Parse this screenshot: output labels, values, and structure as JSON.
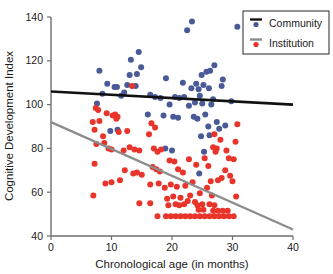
{
  "chart_data": {
    "type": "scatter",
    "title": "",
    "xlabel": "Chronological age (in months)",
    "ylabel": "Cognitive Development Index",
    "xlim": [
      0,
      40
    ],
    "ylim": [
      40,
      140
    ],
    "xticks": [
      0,
      10,
      20,
      30,
      40
    ],
    "yticks": [
      40,
      60,
      80,
      100,
      120,
      140
    ],
    "xtick_labels": [
      "0",
      "10",
      "20",
      "30",
      "40"
    ],
    "ytick_labels": [
      "40",
      "60",
      "80",
      "100",
      "120",
      "140"
    ],
    "grid": false,
    "legend_position": "top-right",
    "legend": [
      {
        "label": "Community",
        "point_color": "#4a5a96",
        "line_color": "#111111"
      },
      {
        "label": "Institution",
        "point_color": "#e8342a",
        "line_color": "#8c8c8c"
      }
    ],
    "series": [
      {
        "name": "Community",
        "marker_color": "#4a5a96",
        "marker_size": 3.0,
        "trendline": {
          "color": "#111111",
          "width": 2.6,
          "x0": 0,
          "y0": 106,
          "x1": 40,
          "y1": 100
        },
        "points": [
          [
            22.5,
            134.0
          ],
          [
            23.3,
            138.0
          ],
          [
            30.8,
            135.5
          ],
          [
            14.5,
            124.0
          ],
          [
            13.2,
            120.5
          ],
          [
            14.9,
            117.0
          ],
          [
            27.0,
            118.0
          ],
          [
            25.7,
            115.0
          ],
          [
            26.3,
            115.5
          ],
          [
            8.0,
            115.5
          ],
          [
            13.0,
            113.5
          ],
          [
            14.2,
            114.0
          ],
          [
            24.9,
            113.5
          ],
          [
            28.4,
            111.5
          ],
          [
            19.0,
            112.0
          ],
          [
            21.8,
            110.0
          ],
          [
            24.0,
            109.5
          ],
          [
            25.2,
            109.0
          ],
          [
            28.2,
            108.5
          ],
          [
            12.6,
            109.0
          ],
          [
            14.0,
            108.5
          ],
          [
            9.3,
            109.5
          ],
          [
            10.5,
            108.0
          ],
          [
            10.9,
            108.0
          ],
          [
            23.2,
            107.5
          ],
          [
            24.4,
            107.0
          ],
          [
            26.1,
            107.5
          ],
          [
            8.5,
            105.0
          ],
          [
            11.6,
            104.0
          ],
          [
            12.1,
            105.5
          ],
          [
            16.4,
            104.5
          ],
          [
            17.2,
            103.5
          ],
          [
            20.5,
            103.5
          ],
          [
            21.2,
            103.0
          ],
          [
            22.0,
            103.5
          ],
          [
            24.6,
            104.0
          ],
          [
            26.8,
            102.5
          ],
          [
            29.8,
            101.5
          ],
          [
            18.1,
            103.0
          ],
          [
            23.8,
            101.0
          ],
          [
            25.0,
            100.5
          ],
          [
            26.5,
            100.0
          ],
          [
            7.6,
            100.5
          ],
          [
            19.6,
            100.0
          ],
          [
            22.8,
            99.5
          ],
          [
            16.0,
            95.5
          ],
          [
            18.6,
            95.0
          ],
          [
            20.2,
            94.5
          ],
          [
            21.0,
            94.0
          ],
          [
            23.6,
            94.5
          ],
          [
            24.2,
            93.5
          ],
          [
            25.5,
            95.5
          ],
          [
            27.4,
            92.0
          ],
          [
            28.8,
            90.5
          ],
          [
            26.0,
            90.0
          ],
          [
            27.8,
            89.0
          ],
          [
            9.8,
            88.0
          ],
          [
            11.0,
            88.5
          ],
          [
            24.8,
            85.5
          ],
          [
            26.2,
            86.0
          ],
          [
            18.9,
            80.0
          ],
          [
            25.3,
            78.5
          ],
          [
            20.0,
            79.0
          ],
          [
            24.5,
            68.5
          ]
        ]
      },
      {
        "name": "Institution",
        "marker_color": "#e8342a",
        "marker_size": 3.0,
        "trendline": {
          "color": "#8c8c8c",
          "width": 2.2,
          "x0": 0,
          "y0": 92,
          "x1": 40,
          "y1": 43
        },
        "points": [
          [
            7.4,
            98.5
          ],
          [
            7.8,
            97.5
          ],
          [
            9.2,
            96.0
          ],
          [
            10.6,
            95.5
          ],
          [
            11.0,
            94.5
          ],
          [
            13.4,
            108.5
          ],
          [
            30.8,
            91.0
          ],
          [
            6.9,
            92.0
          ],
          [
            8.0,
            92.5
          ],
          [
            10.2,
            95.0
          ],
          [
            10.8,
            93.5
          ],
          [
            7.2,
            88.5
          ],
          [
            8.6,
            85.5
          ],
          [
            11.2,
            87.5
          ],
          [
            12.6,
            88.0
          ],
          [
            16.6,
            91.5
          ],
          [
            17.2,
            89.5
          ],
          [
            27.0,
            86.5
          ],
          [
            28.0,
            84.0
          ],
          [
            30.5,
            83.0
          ],
          [
            7.5,
            82.0
          ],
          [
            8.8,
            82.5
          ],
          [
            9.5,
            80.0
          ],
          [
            10.0,
            79.5
          ],
          [
            12.0,
            79.0
          ],
          [
            13.0,
            80.5
          ],
          [
            13.8,
            79.5
          ],
          [
            14.6,
            79.0
          ],
          [
            17.0,
            80.0
          ],
          [
            17.6,
            78.5
          ],
          [
            18.2,
            79.5
          ],
          [
            26.8,
            80.5
          ],
          [
            27.4,
            80.0
          ],
          [
            27.2,
            78.5
          ],
          [
            29.4,
            75.5
          ],
          [
            30.2,
            75.0
          ],
          [
            29.0,
            79.0
          ],
          [
            25.4,
            75.5
          ],
          [
            22.8,
            75.0
          ],
          [
            19.6,
            74.5
          ],
          [
            20.4,
            74.0
          ],
          [
            16.2,
            86.5
          ],
          [
            16.8,
            71.5
          ],
          [
            17.4,
            70.5
          ],
          [
            18.0,
            69.5
          ],
          [
            12.2,
            70.0
          ],
          [
            13.6,
            68.5
          ],
          [
            14.2,
            69.0
          ],
          [
            15.0,
            68.0
          ],
          [
            11.4,
            65.5
          ],
          [
            10.0,
            64.5
          ],
          [
            21.0,
            70.5
          ],
          [
            21.8,
            69.0
          ],
          [
            24.0,
            72.5
          ],
          [
            26.0,
            72.0
          ],
          [
            28.8,
            70.0
          ],
          [
            29.6,
            67.5
          ],
          [
            28.2,
            66.5
          ],
          [
            27.6,
            65.5
          ],
          [
            26.4,
            65.0
          ],
          [
            23.4,
            64.5
          ],
          [
            22.2,
            63.0
          ],
          [
            20.8,
            62.5
          ],
          [
            19.8,
            63.5
          ],
          [
            18.8,
            62.0
          ],
          [
            17.8,
            64.0
          ],
          [
            16.4,
            63.5
          ],
          [
            25.8,
            62.0
          ],
          [
            30.0,
            65.0
          ],
          [
            30.6,
            58.0
          ],
          [
            26.6,
            58.5
          ],
          [
            24.6,
            59.5
          ],
          [
            23.0,
            58.5
          ],
          [
            21.4,
            57.5
          ],
          [
            20.2,
            58.0
          ],
          [
            19.2,
            57.0
          ],
          [
            22.6,
            56.0
          ],
          [
            23.8,
            55.5
          ],
          [
            25.0,
            54.5
          ],
          [
            24.2,
            54.0
          ],
          [
            22.0,
            54.5
          ],
          [
            21.2,
            54.0
          ],
          [
            20.6,
            54.5
          ],
          [
            19.4,
            54.0
          ],
          [
            16.4,
            55.0
          ],
          [
            26.2,
            54.5
          ],
          [
            27.0,
            54.0
          ],
          [
            7.2,
            73.0
          ],
          [
            9.0,
            64.0
          ],
          [
            7.0,
            58.5
          ],
          [
            17.6,
            49.0
          ],
          [
            19.0,
            49.0
          ],
          [
            19.8,
            49.0
          ],
          [
            20.6,
            49.0
          ],
          [
            21.4,
            49.0
          ],
          [
            22.2,
            49.0
          ],
          [
            23.0,
            49.0
          ],
          [
            23.8,
            49.0
          ],
          [
            24.6,
            49.0
          ],
          [
            25.4,
            49.0
          ],
          [
            26.2,
            49.0
          ],
          [
            27.0,
            49.0
          ],
          [
            27.8,
            49.0
          ],
          [
            28.6,
            49.0
          ],
          [
            29.4,
            49.0
          ],
          [
            30.2,
            49.0
          ],
          [
            26.8,
            51.5
          ],
          [
            27.6,
            51.5
          ],
          [
            28.4,
            51.5
          ],
          [
            29.2,
            51.5
          ],
          [
            25.2,
            52.0
          ],
          [
            24.4,
            52.0
          ],
          [
            14.6,
            55.0
          ]
        ]
      }
    ]
  }
}
